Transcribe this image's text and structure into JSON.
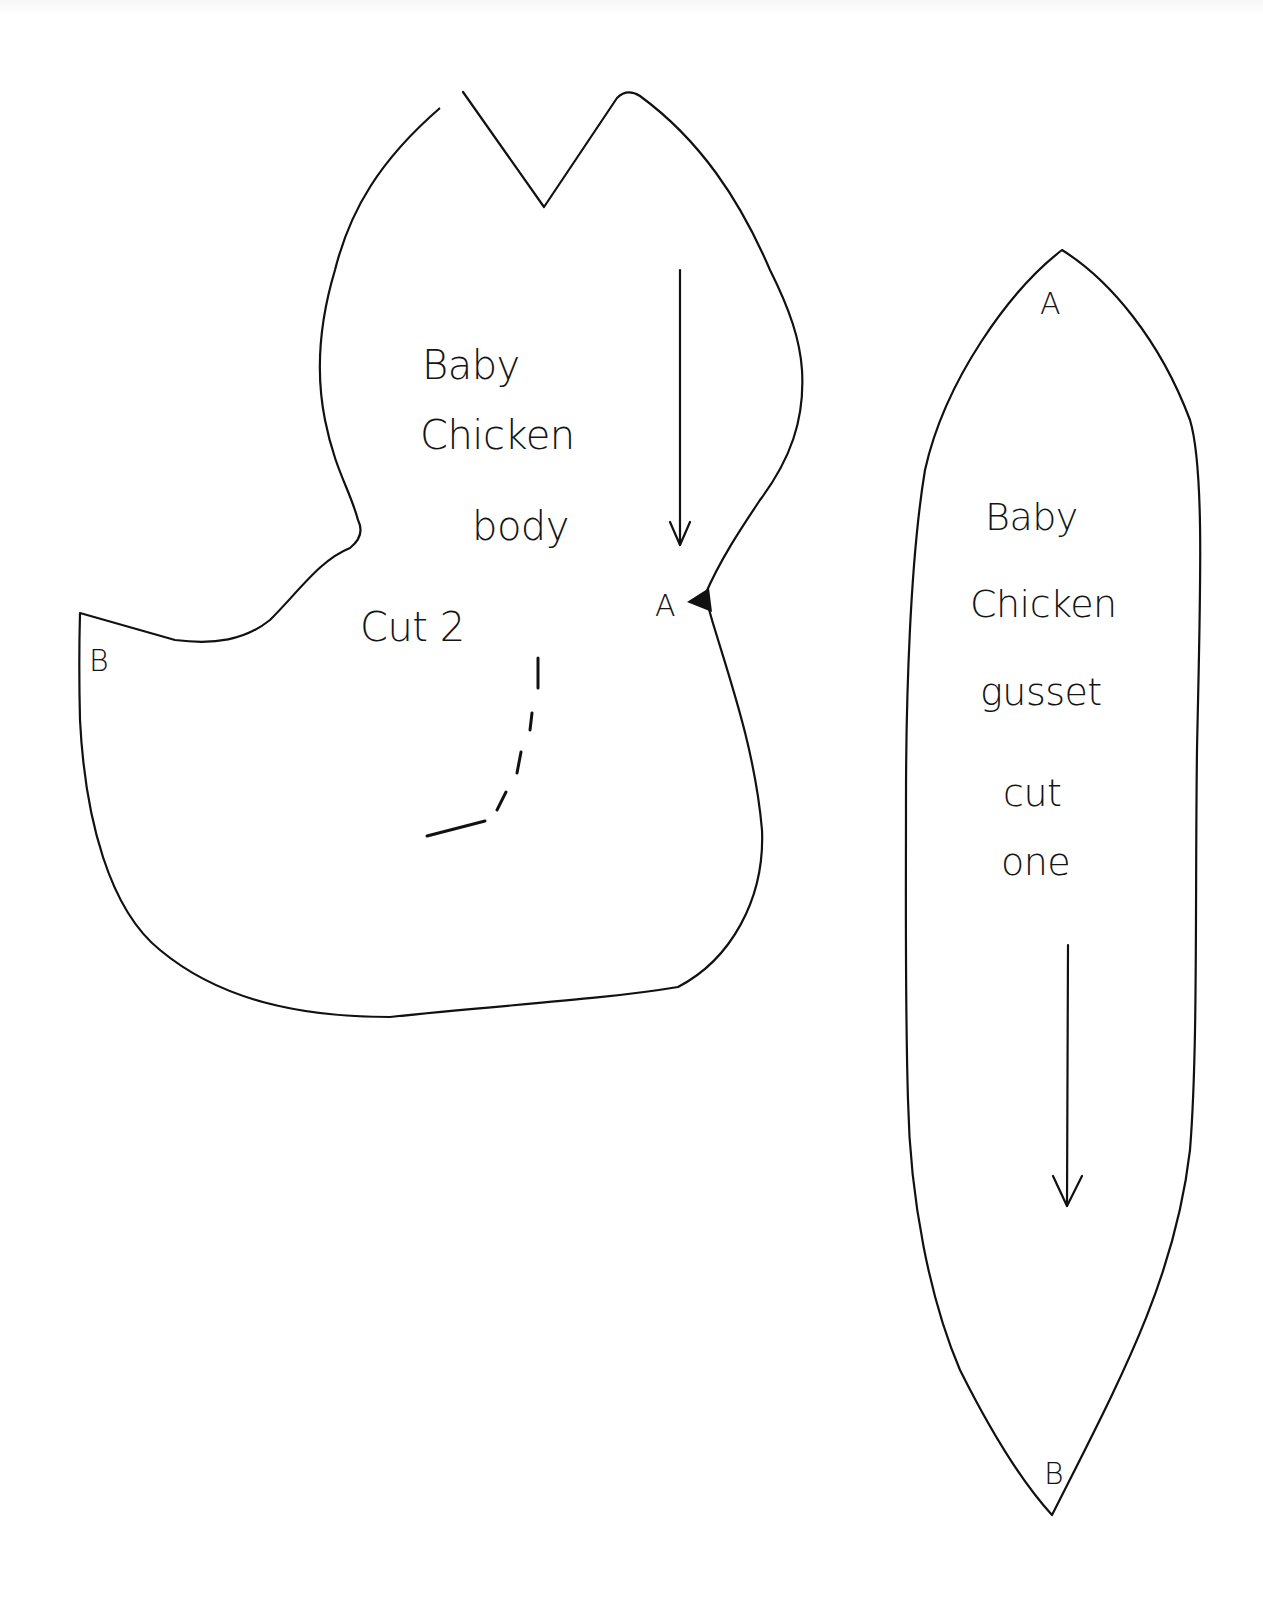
{
  "document": {
    "type": "sewing-pattern",
    "background_color": "#ffffff",
    "ink_color": "#111111"
  },
  "pieces": {
    "body": {
      "title_line1": "Baby",
      "title_line2": "Chicken",
      "title_line3": "body",
      "instruction": "Cut 2",
      "mark_a": "A",
      "mark_b": "B",
      "grainline": "down-arrow",
      "notch": "triangle-notch",
      "placement_line": "dashed-wing-line"
    },
    "gusset": {
      "title_line1": "Baby",
      "title_line2": "Chicken",
      "title_line3": "gusset",
      "instruction_line1": "cut",
      "instruction_line2": "one",
      "mark_a": "A",
      "mark_b": "B",
      "grainline": "down-arrow"
    }
  }
}
